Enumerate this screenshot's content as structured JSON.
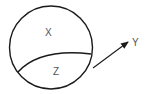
{
  "diagram": {
    "labels": {
      "upper_region": "X",
      "lower_region": "Z",
      "arrow_target": "Y"
    },
    "colors": {
      "stroke": "#1a1a1a",
      "text": "#555555",
      "background": "#ffffff"
    }
  }
}
